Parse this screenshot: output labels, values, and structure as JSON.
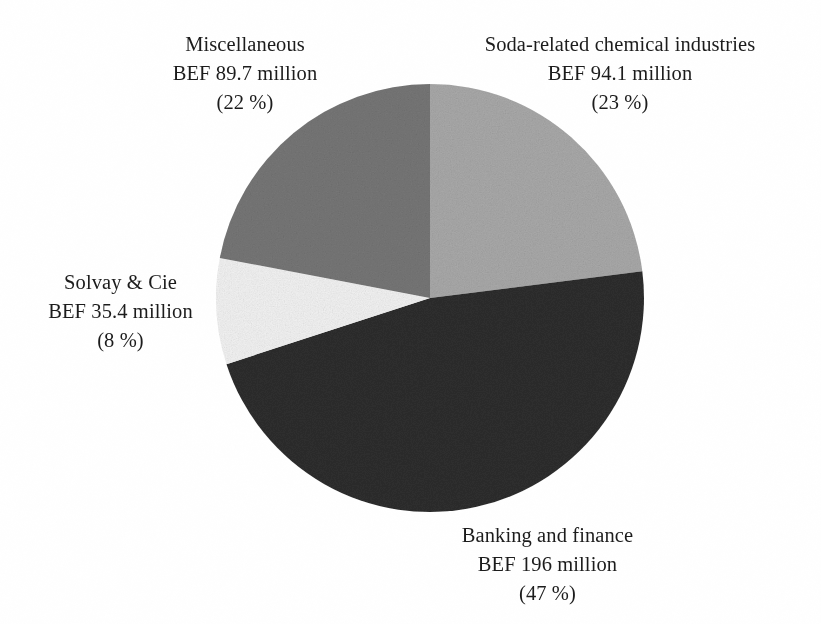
{
  "figure": {
    "background_color": "#ffffff",
    "text_color": "#1c1c1c"
  },
  "chart_data": {
    "type": "pie",
    "title": "",
    "subtitle": "",
    "xlabel": "",
    "ylabel": "",
    "legend_position": "none",
    "grid": false,
    "units": "BEF million",
    "currency": "BEF",
    "start_angle_deg": 0,
    "direction": "clockwise",
    "total_value": 415.2,
    "categories": [
      "Soda-related chemical industries",
      "Banking and finance",
      "Solvay & Cie",
      "Miscellaneous"
    ],
    "values": [
      94.1,
      196,
      35.4,
      89.7
    ],
    "percents": [
      23,
      47,
      8,
      22
    ],
    "colors": [
      "#a9a9a9",
      "#2e2e2e",
      "#f2f2f2",
      "#767676"
    ],
    "slices": [
      {
        "name": "Soda-related chemical industries",
        "value": 94.1,
        "value_text": "BEF 94.1 million",
        "percent": 23,
        "percent_text": "(23 %)",
        "color": "#a9a9a9",
        "start_deg": 0,
        "end_deg": 82.8
      },
      {
        "name": "Banking and finance",
        "value": 196,
        "value_text": "BEF 196 million",
        "percent": 47,
        "percent_text": "(47 %)",
        "color": "#2e2e2e",
        "start_deg": 82.8,
        "end_deg": 252
      },
      {
        "name": "Solvay & Cie",
        "value": 35.4,
        "value_text": "BEF 35.4 million",
        "percent": 8,
        "percent_text": "(8 %)",
        "color": "#f2f2f2",
        "start_deg": 252,
        "end_deg": 280.8
      },
      {
        "name": "Miscellaneous",
        "value": 89.7,
        "value_text": "BEF 89.7 million",
        "percent": 22,
        "percent_text": "(22 %)",
        "color": "#767676",
        "start_deg": 280.8,
        "end_deg": 360
      }
    ]
  },
  "labels": {
    "miscellaneous": {
      "name": "Miscellaneous",
      "value": "BEF 89.7 million",
      "percent": "(22 %)"
    },
    "soda": {
      "name": "Soda-related chemical industries",
      "value": "BEF 94.1 million",
      "percent": "(23 %)"
    },
    "solvay": {
      "name": "Solvay & Cie",
      "value": "BEF 35.4 million",
      "percent": "(8 %)"
    },
    "banking": {
      "name": "Banking and finance",
      "value": "BEF 196 million",
      "percent": "(47 %)"
    }
  }
}
